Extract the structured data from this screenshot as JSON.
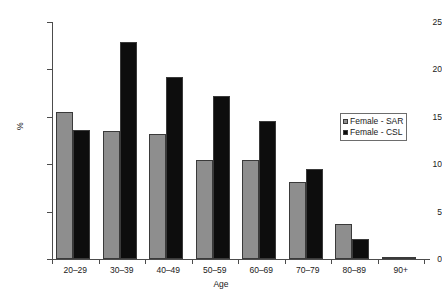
{
  "chart_data": {
    "type": "bar",
    "title": "",
    "subtitle": "",
    "xlabel": "Age",
    "ylabel": "%",
    "categories": [
      "20–29",
      "30–39",
      "40–49",
      "50–59",
      "60–69",
      "70–79",
      "80–89",
      "90+"
    ],
    "series": [
      {
        "name": "Female - SAR",
        "color": "#8e8e8e",
        "values": [
          15.5,
          13.5,
          13.2,
          10.4,
          10.4,
          8.1,
          3.7,
          0.25
        ]
      },
      {
        "name": "Female - CSL",
        "color": "#0d0d0d",
        "values": [
          13.6,
          22.9,
          19.2,
          17.2,
          14.6,
          9.5,
          2.1,
          0.1
        ]
      }
    ],
    "ylim": [
      0,
      25
    ],
    "yticks": [
      0,
      5,
      10,
      15,
      20,
      25
    ],
    "ytick_labels": [
      "0",
      "5",
      "10",
      "15",
      "20",
      "25"
    ],
    "grid": false,
    "legend_position": "right"
  },
  "legend": {
    "entries": [
      {
        "label": "Female - SAR"
      },
      {
        "label": "Female - CSL"
      }
    ]
  },
  "axes": {
    "x_title": "Age",
    "y_title": "%"
  }
}
